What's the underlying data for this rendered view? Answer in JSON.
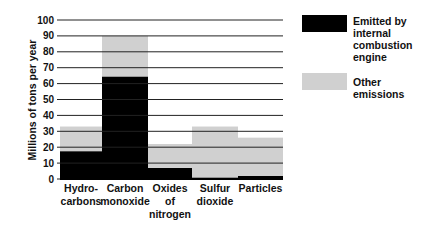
{
  "chart_data": {
    "type": "bar",
    "stacked": true,
    "title": "",
    "xlabel": "",
    "ylabel": "Millions of tons per year",
    "ylim": [
      0,
      100
    ],
    "yticks": [
      0,
      10,
      20,
      30,
      40,
      50,
      60,
      70,
      80,
      90,
      100
    ],
    "grid": true,
    "categories": [
      "Hydro-carbons",
      "Carbon monoxide",
      "Oxides of nitrogen",
      "Sulfur dioxide",
      "Particles"
    ],
    "category_lines": [
      [
        "Hydro-",
        "carbons"
      ],
      [
        "Carbon",
        "monoxide"
      ],
      [
        "Oxides",
        "of",
        "nitrogen"
      ],
      [
        "Sulfur",
        "dioxide"
      ],
      [
        "Particles"
      ]
    ],
    "series": [
      {
        "name": "Emitted by internal combustion engine",
        "color": "#000000",
        "values": [
          17.5,
          64.5,
          7,
          1,
          2
        ]
      },
      {
        "name": "Other emissions",
        "color": "#d0d0d0",
        "values": [
          15.5,
          25.5,
          15,
          32,
          24
        ]
      }
    ],
    "totals": [
      33,
      90,
      22,
      33,
      26
    ],
    "legend_position": "right"
  },
  "legend": {
    "items": [
      {
        "lines": [
          "Emitted by",
          "internal",
          "combustion",
          "engine"
        ],
        "color": "#000000"
      },
      {
        "lines": [
          "Other emissions"
        ],
        "color": "#d0d0d0"
      }
    ]
  }
}
